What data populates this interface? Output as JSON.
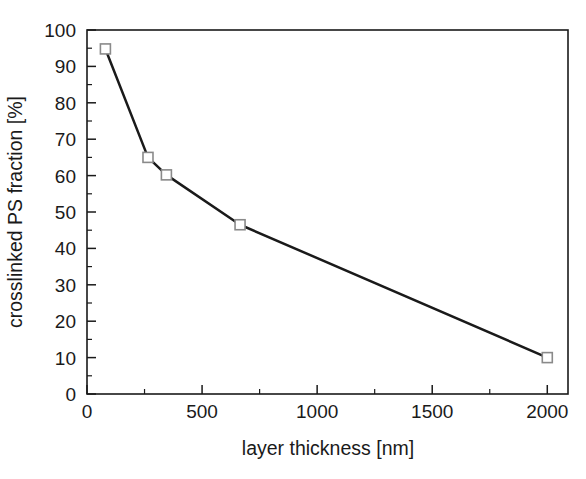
{
  "figure": {
    "background_color": "#ffffff",
    "foreground_color": "#1a1a1a",
    "marker_edge_color": "#8a8a8a",
    "marker_face_color": "#ffffff"
  },
  "chart_data": {
    "type": "line",
    "title": "",
    "xlabel": "layer thickness [nm]",
    "ylabel": "crosslinked PS fraction [%]",
    "xlim": [
      0,
      2090
    ],
    "ylim": [
      0,
      100
    ],
    "grid": false,
    "legend": null,
    "marker": "open-square",
    "line_color": "#1a1a1a",
    "x": [
      80,
      265,
      345,
      665,
      2000
    ],
    "y": [
      94.8,
      65.0,
      60.2,
      46.5,
      10.0
    ],
    "points": [
      {
        "x": 80,
        "y": 94.8
      },
      {
        "x": 265,
        "y": 65.0
      },
      {
        "x": 345,
        "y": 60.2
      },
      {
        "x": 665,
        "y": 46.5
      },
      {
        "x": 2000,
        "y": 10.0
      }
    ],
    "xticks": [
      0,
      500,
      1000,
      1500,
      2000
    ],
    "xticklabels": [
      "0",
      "500",
      "1000",
      "1500",
      "2000"
    ],
    "xminorticks": [
      250,
      750,
      1250,
      1750
    ],
    "yticks": [
      0,
      10,
      20,
      30,
      40,
      50,
      60,
      70,
      80,
      90,
      100
    ],
    "yticklabels": [
      "0",
      "10",
      "20",
      "30",
      "40",
      "50",
      "60",
      "70",
      "80",
      "90",
      "100"
    ],
    "yminorticks": [
      5,
      15,
      25,
      35,
      45,
      55,
      65,
      75,
      85,
      95
    ]
  }
}
